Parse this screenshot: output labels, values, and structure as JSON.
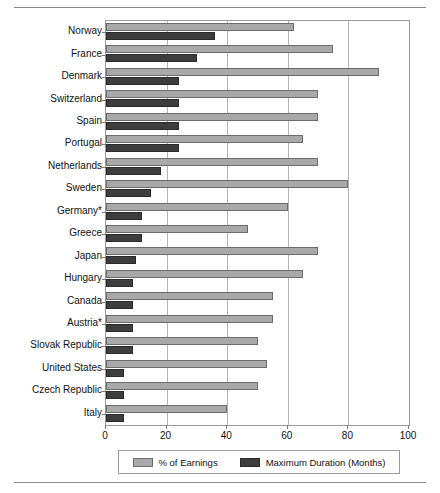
{
  "chart_data": {
    "type": "bar",
    "orientation": "horizontal",
    "title": "",
    "subtitle": "",
    "xlabel": "",
    "ylabel": "",
    "xlim": [
      0,
      100
    ],
    "xticks": [
      0,
      20,
      40,
      60,
      80,
      100
    ],
    "xticklabels": [
      "0",
      "20",
      "40",
      "60",
      "80",
      "100"
    ],
    "grid": true,
    "grid_axis": "x",
    "legend_position": "bottom",
    "categories": [
      "Norway",
      "France",
      "Denmark",
      "Switzerland",
      "Spain",
      "Portugal",
      "Netherlands",
      "Sweden",
      "Germany*",
      "Greece",
      "Japan",
      "Hungary",
      "Canada",
      "Austria*",
      "Slovak Republic",
      "United States",
      "Czech Republic",
      "Italy"
    ],
    "series": [
      {
        "name": "% of Earnings",
        "color": "#a9a9a9",
        "values": [
          62,
          75,
          90,
          70,
          70,
          65,
          70,
          80,
          60,
          47,
          70,
          65,
          55,
          55,
          50,
          53,
          50,
          40
        ]
      },
      {
        "name": "Maximum Duration (Months)",
        "color": "#3d3d3d",
        "values": [
          36,
          30,
          24,
          24,
          24,
          24,
          18,
          15,
          12,
          12,
          10,
          9,
          9,
          9,
          9,
          6,
          6,
          6
        ]
      }
    ]
  },
  "legend": {
    "items": [
      {
        "label": "% of Earnings",
        "swatch": "light"
      },
      {
        "label": "Maximum Duration (Months)",
        "swatch": "dark"
      }
    ]
  }
}
